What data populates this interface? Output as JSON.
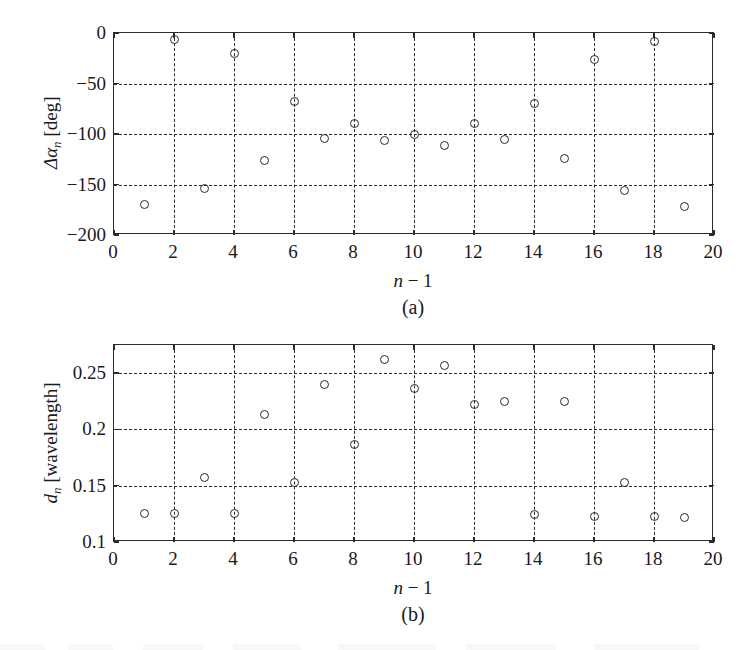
{
  "figure": {
    "panels": [
      {
        "id": "a",
        "panel_label": "(a)",
        "xaxis_label_main": "n",
        "xaxis_label_op": " − 1",
        "yaxis_label_main": "Δα",
        "yaxis_label_sub": "n",
        "yaxis_label_unit": " [deg]"
      },
      {
        "id": "b",
        "panel_label": "(b)",
        "xaxis_label_main": "n",
        "xaxis_label_op": " − 1",
        "yaxis_label_main": "d",
        "yaxis_label_sub": "n",
        "yaxis_label_unit": " [wavelength]"
      }
    ]
  },
  "chart_data": [
    {
      "type": "scatter",
      "title": "",
      "panel": "(a)",
      "xlabel": "n − 1",
      "ylabel": "Δαn [deg]",
      "xlim": [
        0,
        20
      ],
      "ylim": [
        -200,
        0
      ],
      "xticks": [
        0,
        2,
        4,
        6,
        8,
        10,
        12,
        14,
        16,
        18,
        20
      ],
      "xtick_labels": [
        "0",
        "2",
        "4",
        "6",
        "8",
        "10",
        "12",
        "14",
        "16",
        "18",
        "20"
      ],
      "yticks": [
        0,
        -50,
        -100,
        -150,
        -200
      ],
      "ytick_labels": [
        "0",
        "−50",
        "−100",
        "−150",
        "−200"
      ],
      "grid": true,
      "grid_style": "dashed",
      "legend": null,
      "marker": "open-circle",
      "x": [
        1,
        2,
        3,
        4,
        5,
        6,
        7,
        8,
        9,
        10,
        11,
        12,
        13,
        14,
        15,
        16,
        17,
        18,
        19
      ],
      "y": [
        -170,
        -6,
        -154,
        -20,
        -126,
        -68,
        -104,
        -90,
        -106,
        -100,
        -111,
        -90,
        -105,
        -70,
        -124,
        -26,
        -156,
        -8,
        -172
      ]
    },
    {
      "type": "scatter",
      "title": "",
      "panel": "(b)",
      "xlabel": "n − 1",
      "ylabel": "dn [wavelength]",
      "xlim": [
        0,
        20
      ],
      "ylim": [
        0.1,
        0.275
      ],
      "xticks": [
        0,
        2,
        4,
        6,
        8,
        10,
        12,
        14,
        16,
        18,
        20
      ],
      "xtick_labels": [
        "0",
        "2",
        "4",
        "6",
        "8",
        "10",
        "12",
        "14",
        "16",
        "18",
        "20"
      ],
      "yticks": [
        0.25,
        0.2,
        0.15,
        0.1
      ],
      "ytick_labels": [
        "0.25",
        "0.2",
        "0.15",
        "0.1"
      ],
      "grid": true,
      "grid_style": "dashed",
      "legend": null,
      "marker": "open-circle",
      "x": [
        1,
        2,
        3,
        4,
        5,
        6,
        7,
        8,
        9,
        10,
        11,
        12,
        13,
        14,
        15,
        16,
        17,
        18,
        19
      ],
      "y": [
        0.125,
        0.125,
        0.157,
        0.125,
        0.213,
        0.153,
        0.24,
        0.187,
        0.262,
        0.236,
        0.257,
        0.222,
        0.225,
        0.124,
        0.225,
        0.123,
        0.153,
        0.123,
        0.122
      ]
    }
  ],
  "colors": {
    "ink": "#2b2b2b",
    "background": "#ffffff",
    "grid": "#2b2b2b"
  }
}
